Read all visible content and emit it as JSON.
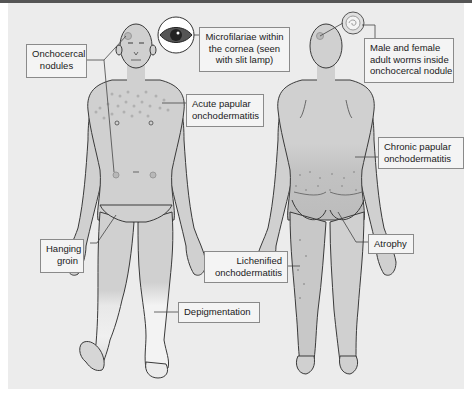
{
  "figure": {
    "views": [
      "front",
      "back"
    ],
    "colors": {
      "background": "#ececec",
      "skin": "#d0d0d0",
      "skin_light": "#f2f2f2",
      "outline": "#3a3a3a",
      "papule": "#b5b5b5",
      "label_border": "#8a8a8a",
      "label_bg": "#f4f4f4",
      "top_bar": "#555555"
    },
    "insets": [
      {
        "name": "eye",
        "icon": "eye-icon",
        "view": "front"
      },
      {
        "name": "nodule-cross-section",
        "icon": "worm-nodule-icon",
        "view": "back"
      }
    ]
  },
  "labels": {
    "onchocercal_nodules": [
      "Onchocercal",
      "nodules"
    ],
    "microfilariae_cornea": [
      "Microfilariae within",
      "the cornea (seen",
      "with slit lamp)"
    ],
    "acute_papular": [
      "Acute papular",
      "onchodermatitis"
    ],
    "male_female_worms": [
      "Male and female",
      "adult worms inside",
      "onchocercal nodule"
    ],
    "chronic_papular": [
      "Chronic papular",
      "onchodermatitis"
    ],
    "hanging_groin": [
      "Hanging",
      "groin"
    ],
    "atrophy": [
      "Atrophy"
    ],
    "lichenified": [
      "Lichenified",
      "onchodermatitis"
    ],
    "depigmentation": [
      "Depigmentation"
    ]
  }
}
